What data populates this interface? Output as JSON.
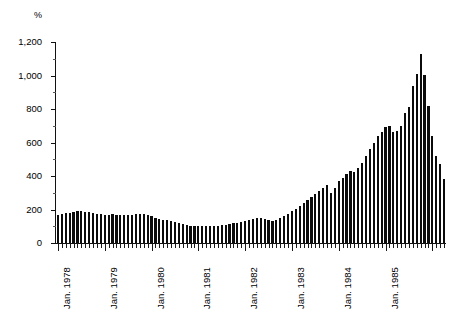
{
  "chart_data": {
    "type": "bar",
    "title": "",
    "subtitle": "",
    "xlabel": "",
    "ylabel": "%",
    "unit_label": "%",
    "ylim": [
      0,
      1200
    ],
    "ytick_values": [
      0,
      200,
      400,
      600,
      800,
      1000,
      1200
    ],
    "ytick_labels": [
      "0",
      "200",
      "400",
      "600",
      "800",
      "1,000",
      "1,200"
    ],
    "grid": false,
    "legend": null,
    "legend_position": "none",
    "bar_color": "#0b0b0b",
    "axis_color": "#111111",
    "x_frequency": "monthly",
    "x_start": "Jan. 1978",
    "x_end": "Dec. 1985",
    "xtick_labels": [
      "Jan. 1978",
      "Jan. 1979",
      "Jan. 1980",
      "Jan. 1981",
      "Jan. 1982",
      "Jan. 1983",
      "Jan. 1984",
      "Jan. 1985"
    ],
    "xtick_label_rotation": -90,
    "categories": [
      "Jan. 1978",
      "Feb. 1978",
      "Mar. 1978",
      "Apr. 1978",
      "May 1978",
      "Jun. 1978",
      "Jul. 1978",
      "Aug. 1978",
      "Sep. 1978",
      "Oct. 1978",
      "Nov. 1978",
      "Dec. 1978",
      "Jan. 1979",
      "Feb. 1979",
      "Mar. 1979",
      "Apr. 1979",
      "May 1979",
      "Jun. 1979",
      "Jul. 1979",
      "Aug. 1979",
      "Sep. 1979",
      "Oct. 1979",
      "Nov. 1979",
      "Dec. 1979",
      "Jan. 1980",
      "Feb. 1980",
      "Mar. 1980",
      "Apr. 1980",
      "May 1980",
      "Jun. 1980",
      "Jul. 1980",
      "Aug. 1980",
      "Sep. 1980",
      "Oct. 1980",
      "Nov. 1980",
      "Dec. 1980",
      "Jan. 1981",
      "Feb. 1981",
      "Mar. 1981",
      "Apr. 1981",
      "May 1981",
      "Jun. 1981",
      "Jul. 1981",
      "Aug. 1981",
      "Sep. 1981",
      "Oct. 1981",
      "Nov. 1981",
      "Dec. 1981",
      "Jan. 1982",
      "Feb. 1982",
      "Mar. 1982",
      "Apr. 1982",
      "May 1982",
      "Jun. 1982",
      "Jul. 1982",
      "Aug. 1982",
      "Sep. 1982",
      "Oct. 1982",
      "Nov. 1982",
      "Dec. 1982",
      "Jan. 1983",
      "Feb. 1983",
      "Mar. 1983",
      "Apr. 1983",
      "May 1983",
      "Jun. 1983",
      "Jul. 1983",
      "Aug. 1983",
      "Sep. 1983",
      "Oct. 1983",
      "Nov. 1983",
      "Dec. 1983",
      "Jan. 1984",
      "Feb. 1984",
      "Mar. 1984",
      "Apr. 1984",
      "May 1984",
      "Jun. 1984",
      "Jul. 1984",
      "Aug. 1984",
      "Sep. 1984",
      "Oct. 1984",
      "Nov. 1984",
      "Dec. 1984",
      "Jan. 1985",
      "Feb. 1985",
      "Mar. 1985",
      "Apr. 1985",
      "May 1985",
      "Jun. 1985",
      "Jul. 1985",
      "Aug. 1985",
      "Sep. 1985",
      "Oct. 1985",
      "Nov. 1985",
      "Dec. 1985"
    ],
    "values": [
      170,
      175,
      178,
      182,
      186,
      190,
      192,
      188,
      183,
      178,
      174,
      172,
      170,
      170,
      172,
      170,
      168,
      166,
      165,
      168,
      172,
      175,
      172,
      168,
      160,
      150,
      142,
      138,
      135,
      132,
      128,
      120,
      112,
      106,
      102,
      100,
      100,
      102,
      104,
      103,
      102,
      104,
      106,
      110,
      114,
      118,
      122,
      126,
      132,
      138,
      144,
      150,
      148,
      142,
      136,
      134,
      140,
      150,
      162,
      175,
      190,
      205,
      222,
      240,
      258,
      275,
      292,
      310,
      330,
      348,
      300,
      330,
      368,
      390,
      412,
      432,
      425,
      450,
      480,
      520,
      560,
      600,
      640,
      660,
      690,
      700,
      660,
      670,
      700,
      775,
      810,
      935,
      1010,
      1130,
      1005,
      820
    ],
    "tail_values": [
      640,
      520,
      470,
      380
    ],
    "peak_value": 1130,
    "peak_category": "Oct. 1985",
    "min_value": 100,
    "min_category": "Dec. 1980"
  }
}
